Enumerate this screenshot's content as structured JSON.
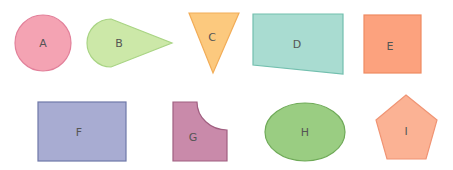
{
  "shapes": [
    {
      "id": "A",
      "label": "A",
      "type": "circle",
      "fill": "#f4a3b3",
      "stroke": "#e2809a"
    },
    {
      "id": "B",
      "label": "B",
      "type": "teardrop",
      "fill": "#cce8a8",
      "stroke": "#a9d484"
    },
    {
      "id": "C",
      "label": "C",
      "type": "inverted-triangle",
      "fill": "#fcc97e",
      "stroke": "#f2ad58"
    },
    {
      "id": "D",
      "label": "D",
      "type": "trapezoid",
      "fill": "#a9dcd1",
      "stroke": "#72bfae"
    },
    {
      "id": "E",
      "label": "E",
      "type": "square",
      "fill": "#fca27e",
      "stroke": "#ef8a62"
    },
    {
      "id": "F",
      "label": "F",
      "type": "rectangle",
      "fill": "#a8acd2",
      "stroke": "#6f78a8"
    },
    {
      "id": "G",
      "label": "G",
      "type": "notched-square",
      "fill": "#c98aaa",
      "stroke": "#a05f80"
    },
    {
      "id": "H",
      "label": "H",
      "type": "ellipse",
      "fill": "#9acd82",
      "stroke": "#6faa58"
    },
    {
      "id": "I",
      "label": "I",
      "type": "pentagon",
      "fill": "#fbb294",
      "stroke": "#f09474"
    }
  ]
}
